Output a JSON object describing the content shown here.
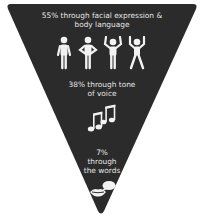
{
  "diagram": {
    "type": "inverted-triangle-infographic",
    "background_color": "#ffffff",
    "shape_color": "#2b2b2b",
    "text_color": "#e6e6e6",
    "sections": [
      {
        "label_line1": "55% through facial expression &",
        "label_line2": "body language",
        "percent": 55,
        "icon": "people-body-language-icon"
      },
      {
        "label_line1": "38% through tone",
        "label_line2": "of voice",
        "percent": 38,
        "icon": "music-notes-icon"
      },
      {
        "label_line1": "7%",
        "label_line2": "through",
        "label_line3": "the words",
        "percent": 7,
        "icon": "speech-lips-icon"
      }
    ]
  }
}
